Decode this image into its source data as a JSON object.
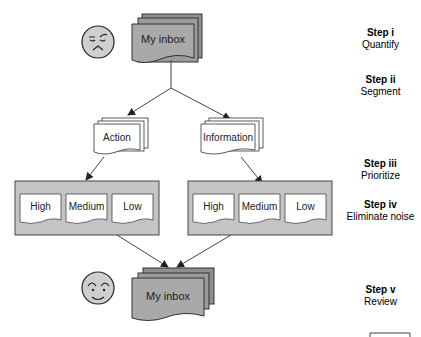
{
  "diagram": {
    "top_inbox": {
      "label": "My inbox",
      "face": "frowning-face"
    },
    "categories": [
      {
        "label": "Action"
      },
      {
        "label": "Information"
      }
    ],
    "priority_groups": [
      {
        "name": "action",
        "levels": [
          "High",
          "Medium",
          "Low"
        ]
      },
      {
        "name": "information",
        "levels": [
          "High",
          "Medium",
          "Low"
        ]
      }
    ],
    "bottom_inbox": {
      "label": "My inbox",
      "face": "smiling-face"
    },
    "colors": {
      "inbox_fill": "#a9a9a9",
      "group_fill": "#c4c4c4",
      "doc_fill": "#ffffff",
      "stroke": "#333333"
    }
  },
  "steps": [
    {
      "num": "Step i",
      "desc": "Quantify"
    },
    {
      "num": "Step ii",
      "desc": "Segment"
    },
    {
      "num": "Step iii",
      "desc": "Prioritize"
    },
    {
      "num": "Step iv",
      "desc": "Eliminate noise"
    },
    {
      "num": "Step v",
      "desc": "Review"
    }
  ]
}
